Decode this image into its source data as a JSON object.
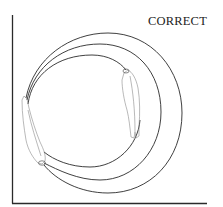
{
  "figure": {
    "label": "CORRECT",
    "axes": {
      "x_axis": true,
      "y_axis": true
    },
    "elements": [
      {
        "type": "arc",
        "name": "outer-swing-path"
      },
      {
        "type": "arc",
        "name": "middle-swing-path"
      },
      {
        "type": "arc",
        "name": "inner-swing-path"
      },
      {
        "type": "sketch",
        "name": "arm-start-position"
      },
      {
        "type": "sketch",
        "name": "arm-end-position"
      }
    ],
    "colors": {
      "line": "#2a2a2a",
      "sketch": "#8a8a8a",
      "background": "#ffffff"
    }
  }
}
